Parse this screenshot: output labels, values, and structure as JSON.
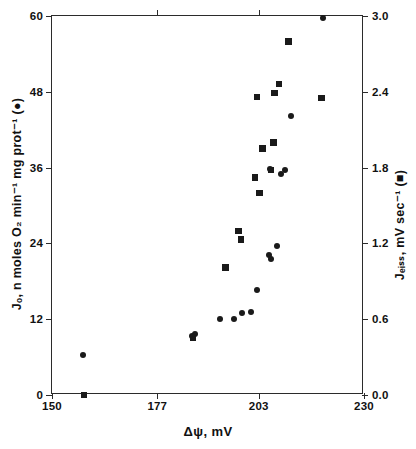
{
  "chart_data": {
    "type": "scatter",
    "title": "",
    "xlabel": "Δψ, mV",
    "ylabel": "Jₒ, n moles O₂ min⁻¹ mg prot⁻¹ (●)",
    "ylabel_right": "Jₑᵢₛₛ, mV sec⁻¹ (■)",
    "xlim": [
      150,
      230
    ],
    "ylim": [
      0,
      60
    ],
    "ylim_right": [
      0.0,
      3.0
    ],
    "xticks": [
      150,
      177,
      203,
      230
    ],
    "xticklabels": [
      "150",
      "177",
      "203",
      "230"
    ],
    "yticks": [
      0,
      12,
      24,
      36,
      48,
      60
    ],
    "yticklabels": [
      "0",
      "12",
      "24",
      "36",
      "48",
      "60"
    ],
    "yticks_right": [
      0.0,
      0.6,
      1.2,
      1.8,
      2.4,
      3.0
    ],
    "yticklabels_right": [
      "0.0",
      "0.6",
      "1.2",
      "1.8",
      "2.4",
      "3.0"
    ],
    "grid": false,
    "legend": "inline-in-axis-labels",
    "marker_color": "#1a1a1a",
    "frame_color": "#2b2b2b",
    "series": [
      {
        "name": "Jₒ (respiration rate)",
        "marker": "circle",
        "axis": "left",
        "points": [
          {
            "x": 158.0,
            "y": 6.3
          },
          {
            "x": 186.0,
            "y": 9.3
          },
          {
            "x": 186.7,
            "y": 9.6
          },
          {
            "x": 193.0,
            "y": 12.0
          },
          {
            "x": 196.6,
            "y": 12.1
          },
          {
            "x": 198.6,
            "y": 13.0
          },
          {
            "x": 201.0,
            "y": 13.2
          },
          {
            "x": 202.5,
            "y": 16.7
          },
          {
            "x": 205.6,
            "y": 22.2
          },
          {
            "x": 207.7,
            "y": 23.6
          },
          {
            "x": 206.2,
            "y": 21.6
          },
          {
            "x": 205.8,
            "y": 35.8
          },
          {
            "x": 208.8,
            "y": 35.0
          },
          {
            "x": 209.8,
            "y": 35.6
          },
          {
            "x": 211.4,
            "y": 44.2
          },
          {
            "x": 219.6,
            "y": 59.7
          }
        ]
      },
      {
        "name": "Jₑᵢₛₛ (proton leak)",
        "marker": "square",
        "axis": "right",
        "points": [
          {
            "x": 158.2,
            "y": 0.0
          },
          {
            "x": 186.1,
            "y": 0.45
          },
          {
            "x": 194.5,
            "y": 1.01
          },
          {
            "x": 197.8,
            "y": 1.3
          },
          {
            "x": 198.4,
            "y": 1.23
          },
          {
            "x": 203.2,
            "y": 1.6
          },
          {
            "x": 202.1,
            "y": 1.72
          },
          {
            "x": 206.2,
            "y": 1.78
          },
          {
            "x": 204.0,
            "y": 1.95
          },
          {
            "x": 206.8,
            "y": 2.0
          },
          {
            "x": 202.6,
            "y": 2.36
          },
          {
            "x": 207.0,
            "y": 2.39
          },
          {
            "x": 208.2,
            "y": 2.46
          },
          {
            "x": 210.6,
            "y": 2.8
          },
          {
            "x": 219.1,
            "y": 2.35
          }
        ]
      }
    ]
  },
  "figure": {
    "background": "#ffffff",
    "plot_left_px": 51,
    "plot_top_px": 15,
    "plot_width_px": 312,
    "plot_height_px": 379
  }
}
